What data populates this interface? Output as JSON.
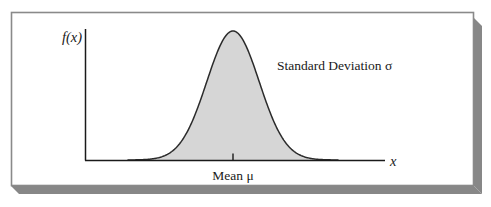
{
  "figure": {
    "title_caption": "",
    "frame": {
      "border_color": "#8a8a8a",
      "shadow_color": "#878787",
      "background_color": "#ffffff"
    },
    "axes": {
      "axis_color": "#1a1a1a",
      "y_axis_label": "f(x)",
      "x_axis_label": "x",
      "mean_tick_label": "Mean μ",
      "annotation_label": "Standard Deviation σ"
    },
    "curve": {
      "fill_color": "#d6d6d6",
      "stroke_color": "#2b2b2b"
    }
  },
  "chart_data": {
    "type": "line",
    "title": "",
    "subtitle": "",
    "xlabel": "x",
    "ylabel": "f(x)",
    "legend": [],
    "grid": false,
    "annotations": [
      {
        "text": "Standard Deviation σ",
        "x": 1.55,
        "y": 0.85
      },
      {
        "text": "Mean μ",
        "x": 0.0,
        "y": -0.12
      }
    ],
    "tick_labels": {
      "x": [
        "Mean μ"
      ],
      "y": []
    },
    "xlim": [
      -4.0,
      4.0
    ],
    "ylim": [
      0,
      1.08
    ],
    "series": [
      {
        "name": "Normal probability density",
        "distribution": "normal",
        "mean": 0,
        "standard_deviation": 1,
        "filled": true,
        "x": [
          -4.0,
          -3.6,
          -3.2,
          -2.8,
          -2.4,
          -2.0,
          -1.6,
          -1.2,
          -0.8,
          -0.4,
          0.0,
          0.4,
          0.8,
          1.2,
          1.6,
          2.0,
          2.4,
          2.8,
          3.2,
          3.6,
          4.0
        ],
        "values": [
          0.0,
          0.001,
          0.006,
          0.02,
          0.056,
          0.135,
          0.278,
          0.487,
          0.726,
          0.923,
          1.0,
          0.923,
          0.726,
          0.487,
          0.278,
          0.135,
          0.056,
          0.02,
          0.006,
          0.001,
          0.0
        ]
      }
    ]
  }
}
